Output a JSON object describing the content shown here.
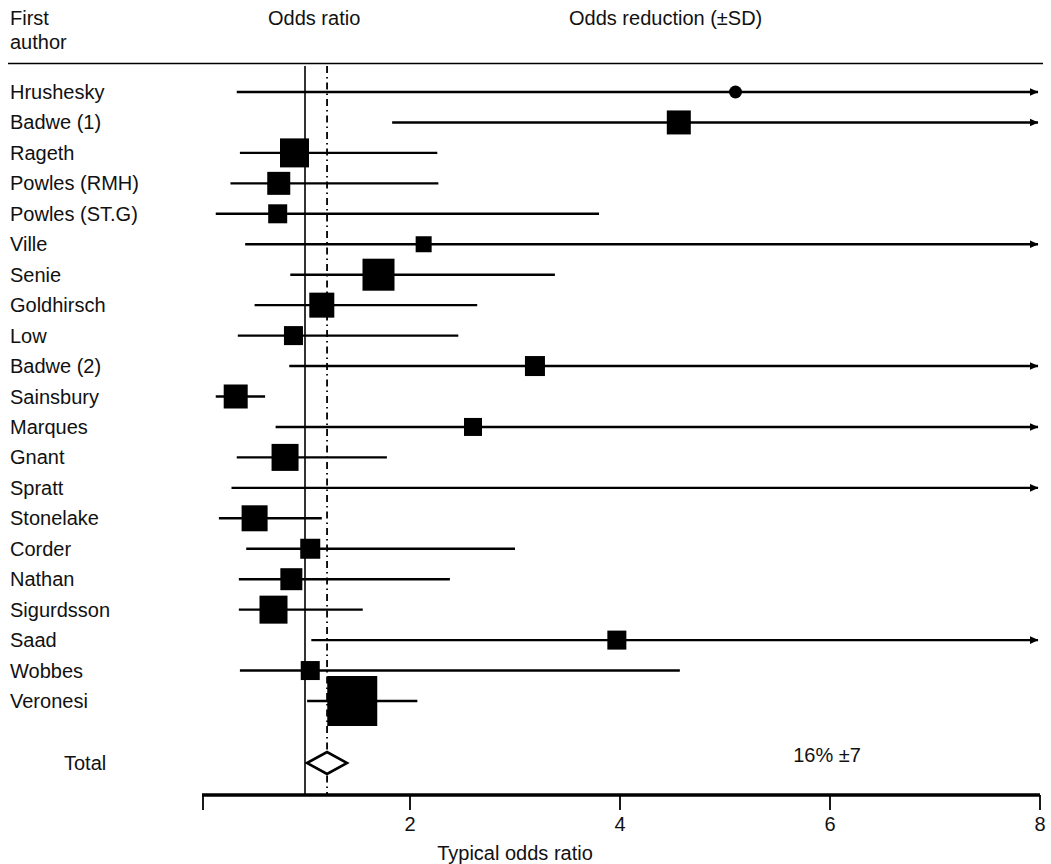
{
  "header": {
    "col_first_author_line1": "First",
    "col_first_author_line2": "author",
    "col_odds_ratio": "Odds ratio",
    "col_odds_reduction": "Odds reduction (±SD)"
  },
  "axis": {
    "title": "Typical odds ratio",
    "ticks": [
      2,
      4,
      6,
      8
    ],
    "tick_labels": [
      "2",
      "4",
      "6",
      "8"
    ],
    "min": 0,
    "max": 8,
    "null_line": 1,
    "summary_line": 1.21
  },
  "total": {
    "label": "Total",
    "stat": "16% ±7",
    "odds_ratio": 1.21,
    "ci_low": 1.02,
    "ci_high": 1.4
  },
  "colors": {
    "ink": "#000000",
    "text": "#111111",
    "background": "#ffffff"
  },
  "chart_data": {
    "type": "forest",
    "title": "",
    "xlabel": "Typical odds ratio",
    "ylabel": "",
    "xlim": [
      0,
      8
    ],
    "xticks": [
      2,
      4,
      6,
      8
    ],
    "grid": false,
    "reference_lines": [
      {
        "name": "null-line",
        "value": 1,
        "style": "solid"
      },
      {
        "name": "summary-line",
        "value": 1.21,
        "style": "dash-dot"
      }
    ],
    "marker_legend": {
      "circle": "Hrushesky",
      "square": "all other studies",
      "diamond": "Total"
    },
    "studies": [
      {
        "label": "Hrushesky",
        "or": 5.1,
        "ci_low": 0.35,
        "ci_high": 8.0,
        "right_arrow": true,
        "marker": "circle",
        "size": 13
      },
      {
        "label": "Badwe (1)",
        "or": 4.56,
        "ci_low": 1.83,
        "ci_high": 8.0,
        "right_arrow": true,
        "marker": "square",
        "size": 24
      },
      {
        "label": "Rageth",
        "or": 0.9,
        "ci_low": 0.38,
        "ci_high": 2.26,
        "right_arrow": false,
        "marker": "square",
        "size": 29
      },
      {
        "label": "Powles (RMH)",
        "or": 0.75,
        "ci_low": 0.29,
        "ci_high": 2.27,
        "right_arrow": false,
        "marker": "square",
        "size": 23
      },
      {
        "label": "Powles (ST.G)",
        "or": 0.74,
        "ci_low": 0.15,
        "ci_high": 3.8,
        "right_arrow": false,
        "marker": "square",
        "size": 19
      },
      {
        "label": "Ville",
        "or": 2.13,
        "ci_low": 0.43,
        "ci_high": 8.0,
        "right_arrow": true,
        "marker": "square",
        "size": 16
      },
      {
        "label": "Senie",
        "or": 1.7,
        "ci_low": 0.86,
        "ci_high": 3.38,
        "right_arrow": false,
        "marker": "square",
        "size": 32
      },
      {
        "label": "Goldhirsch",
        "or": 1.16,
        "ci_low": 0.52,
        "ci_high": 2.64,
        "right_arrow": false,
        "marker": "square",
        "size": 25
      },
      {
        "label": "Low",
        "or": 0.89,
        "ci_low": 0.36,
        "ci_high": 2.46,
        "right_arrow": false,
        "marker": "square",
        "size": 19
      },
      {
        "label": "Badwe (2)",
        "or": 3.19,
        "ci_low": 0.85,
        "ci_high": 8.0,
        "right_arrow": true,
        "marker": "square",
        "size": 20
      },
      {
        "label": "Sainsbury",
        "or": 0.34,
        "ci_low": 0.15,
        "ci_high": 0.62,
        "right_arrow": false,
        "marker": "square",
        "size": 24
      },
      {
        "label": "Marques",
        "or": 2.6,
        "ci_low": 0.72,
        "ci_high": 8.0,
        "right_arrow": true,
        "marker": "square",
        "size": 18
      },
      {
        "label": "Gnant",
        "or": 0.81,
        "ci_low": 0.35,
        "ci_high": 1.78,
        "right_arrow": false,
        "marker": "square",
        "size": 27
      },
      {
        "label": "Spratt",
        "or": null,
        "ci_low": 0.3,
        "ci_high": 8.0,
        "right_arrow": true,
        "marker": "none",
        "size": 0
      },
      {
        "label": "Stonelake",
        "or": 0.52,
        "ci_low": 0.18,
        "ci_high": 1.16,
        "right_arrow": false,
        "marker": "square",
        "size": 26
      },
      {
        "label": "Corder",
        "or": 1.05,
        "ci_low": 0.44,
        "ci_high": 3.0,
        "right_arrow": false,
        "marker": "square",
        "size": 20
      },
      {
        "label": "Nathan",
        "or": 0.87,
        "ci_low": 0.37,
        "ci_high": 2.38,
        "right_arrow": false,
        "marker": "square",
        "size": 22
      },
      {
        "label": "Sigurdsson",
        "or": 0.7,
        "ci_low": 0.37,
        "ci_high": 1.55,
        "right_arrow": false,
        "marker": "square",
        "size": 28
      },
      {
        "label": "Saad",
        "or": 3.97,
        "ci_low": 1.06,
        "ci_high": 8.0,
        "right_arrow": true,
        "marker": "square",
        "size": 19
      },
      {
        "label": "Wobbes",
        "or": 1.05,
        "ci_low": 0.38,
        "ci_high": 4.57,
        "right_arrow": false,
        "marker": "square",
        "size": 19
      },
      {
        "label": "Veronesi",
        "or": 1.45,
        "ci_low": 1.02,
        "ci_high": 2.07,
        "right_arrow": false,
        "marker": "square",
        "size": 50
      }
    ],
    "summary": {
      "label": "Total",
      "or": 1.21,
      "ci_low": 1.02,
      "ci_high": 1.4,
      "annotation": "16% ±7"
    }
  }
}
